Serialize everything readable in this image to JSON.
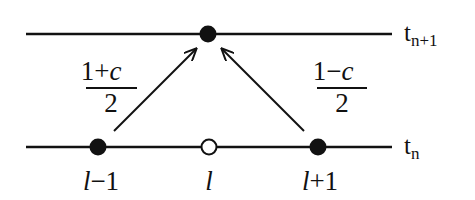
{
  "diagram": {
    "type": "finite-difference-stencil",
    "levels": [
      {
        "id": "top",
        "label_base": "t",
        "label_sub": "n+1",
        "y": 34
      },
      {
        "id": "bottom",
        "label_base": "t",
        "label_sub": "n",
        "y": 147
      }
    ],
    "nodes": [
      {
        "id": "top-node",
        "level": "top",
        "x": 208,
        "filled": true
      },
      {
        "id": "left-node",
        "level": "bottom",
        "x": 98,
        "filled": true,
        "label_var": "l",
        "label_rest": "−1"
      },
      {
        "id": "center-node",
        "level": "bottom",
        "x": 209,
        "filled": false,
        "label_var": "l",
        "label_rest": ""
      },
      {
        "id": "right-node",
        "level": "bottom",
        "x": 318,
        "filled": true,
        "label_var": "l",
        "label_rest": "+1"
      }
    ],
    "edges": [
      {
        "from": "left-node",
        "to": "top-node",
        "weight_num_a": "1+",
        "weight_num_c": "c",
        "weight_den": "2"
      },
      {
        "from": "right-node",
        "to": "top-node",
        "weight_num_a": "1−",
        "weight_num_c": "c",
        "weight_den": "2"
      }
    ],
    "colors": {
      "ink": "#111111",
      "background": "#ffffff"
    }
  }
}
